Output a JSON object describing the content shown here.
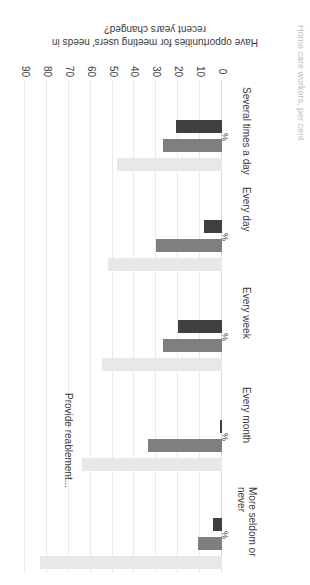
{
  "chart_data": {
    "type": "bar",
    "orientation": "horizontal",
    "rotated_180": true,
    "title": "",
    "xlabel": "Provide reablement...",
    "ylabel": "Have opportunities for meeting users' needs in recent years changed?",
    "value_axis_title": "Home care workers, per cent",
    "unit_marker": "%",
    "xlim": [
      0,
      90
    ],
    "ticks": [
      0,
      10,
      20,
      30,
      40,
      50,
      60,
      70,
      80,
      90
    ],
    "grid": true,
    "legend": "none",
    "categories": [
      "Several times a day",
      "Every day",
      "Every week",
      "Every month",
      "More seldom or never"
    ],
    "series": [
      {
        "name": "series-dark",
        "color": "#404040",
        "values": [
          21,
          8,
          20,
          1,
          4
        ]
      },
      {
        "name": "series-medium",
        "color": "#7f7f7f",
        "values": [
          27,
          30,
          27,
          34,
          11
        ]
      },
      {
        "name": "series-light",
        "color": "#e8e8e8",
        "values": [
          48,
          52,
          55,
          64,
          83
        ]
      }
    ]
  },
  "axis": {
    "value_title": "Have opportunities for meeting users' needs in recent years changed?",
    "category_title": "Provide reablement...",
    "series_title": "Home care workers, per cent",
    "percent_symbol": "%",
    "tick_0": "0",
    "tick_10": "10",
    "tick_20": "20",
    "tick_30": "30",
    "tick_40": "40",
    "tick_50": "50",
    "tick_60": "60",
    "tick_70": "70",
    "tick_80": "80",
    "tick_90": "90"
  },
  "categories": {
    "c0": "Several times a day",
    "c1": "Every day",
    "c2": "Every week",
    "c3": "Every month",
    "c4": "More seldom or\nnever"
  }
}
